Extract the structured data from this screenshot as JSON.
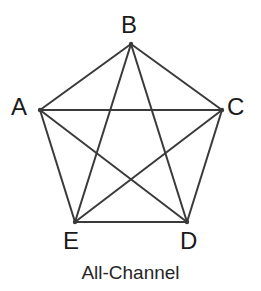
{
  "diagram": {
    "caption": "All-Channel",
    "type": "complete-graph-k5",
    "stroke_color": "#3a3a3a",
    "background_color": "#ffffff",
    "label_color": "#1a1a1a",
    "stroke_width": 2,
    "nodes": [
      {
        "id": "A",
        "label": "A",
        "x": 40,
        "y": 110,
        "label_x": 11,
        "label_y": 95
      },
      {
        "id": "B",
        "label": "B",
        "x": 131,
        "y": 44,
        "label_x": 121,
        "label_y": 13
      },
      {
        "id": "C",
        "label": "C",
        "x": 222,
        "y": 110,
        "label_x": 227,
        "label_y": 95
      },
      {
        "id": "D",
        "label": "D",
        "x": 187,
        "y": 222,
        "label_x": 180,
        "label_y": 229
      },
      {
        "id": "E",
        "label": "E",
        "x": 75,
        "y": 222,
        "label_x": 63,
        "label_y": 229
      }
    ],
    "edges": [
      {
        "from": "A",
        "to": "B"
      },
      {
        "from": "A",
        "to": "C"
      },
      {
        "from": "A",
        "to": "D"
      },
      {
        "from": "A",
        "to": "E"
      },
      {
        "from": "B",
        "to": "C"
      },
      {
        "from": "B",
        "to": "D"
      },
      {
        "from": "B",
        "to": "E"
      },
      {
        "from": "C",
        "to": "D"
      },
      {
        "from": "C",
        "to": "E"
      },
      {
        "from": "D",
        "to": "E"
      }
    ]
  }
}
